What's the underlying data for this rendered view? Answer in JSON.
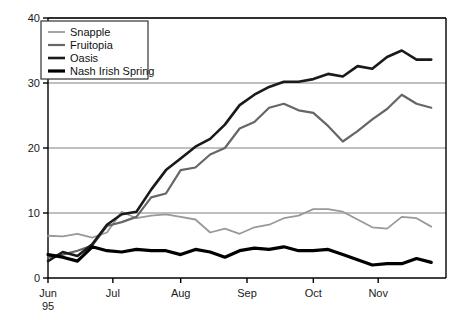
{
  "chart_data": {
    "type": "line",
    "title": "",
    "subtitle": "",
    "xlabel": "",
    "ylabel": "",
    "xlim": [
      0,
      27
    ],
    "ylim": [
      0,
      40
    ],
    "yticks": [
      0,
      10,
      20,
      30,
      40
    ],
    "ytick_labels": [
      "0",
      "10",
      "20",
      "30",
      "40"
    ],
    "xticks": [
      0,
      4.4,
      9.0,
      13.5,
      18.0,
      22.4
    ],
    "xtick_labels": [
      "Jun",
      "Jul",
      "Aug",
      "Sep",
      "Oct",
      "Nov"
    ],
    "x_first_tick_sublabel": "95",
    "grid": "horizontal",
    "grid_color": "#808080",
    "legend_position": "top-left",
    "axis_color": "#000000",
    "x": [
      0,
      1,
      2,
      3,
      4,
      5,
      6,
      7,
      8,
      9,
      10,
      11,
      12,
      13,
      14,
      15,
      16,
      17,
      18,
      19,
      20,
      21,
      22,
      23,
      24,
      25,
      26
    ],
    "series": [
      {
        "name": "Snapple",
        "color": "#999999",
        "width": 1.8,
        "values": [
          6.5,
          6.4,
          6.8,
          6.2,
          7.0,
          10.2,
          9.2,
          9.6,
          9.8,
          9.4,
          9.0,
          7.0,
          7.6,
          6.8,
          7.8,
          8.2,
          9.2,
          9.6,
          10.6,
          10.6,
          10.2,
          9.0,
          7.8,
          7.6,
          9.4,
          9.2,
          7.9
        ]
      },
      {
        "name": "Fruitopia",
        "color": "#666666",
        "width": 2.2,
        "values": [
          3.2,
          3.6,
          4.2,
          5.0,
          8.0,
          8.6,
          9.4,
          12.4,
          13.0,
          16.6,
          17.0,
          19.0,
          20.0,
          23.0,
          24.0,
          26.2,
          26.8,
          25.8,
          25.4,
          23.4,
          21.0,
          22.6,
          24.4,
          26.0,
          28.2,
          26.8,
          26.2
        ]
      },
      {
        "name": "Oasis",
        "color": "#1a1a1a",
        "width": 2.6,
        "values": [
          2.6,
          4.0,
          3.4,
          5.2,
          8.2,
          9.8,
          10.2,
          13.6,
          16.6,
          18.4,
          20.2,
          21.4,
          23.6,
          26.6,
          28.2,
          29.4,
          30.2,
          30.2,
          30.6,
          31.4,
          31.0,
          32.6,
          32.2,
          34.0,
          35.0,
          33.6,
          33.6
        ]
      },
      {
        "name": "Nash Irish Spring",
        "color": "#000000",
        "width": 3.2,
        "values": [
          3.6,
          3.2,
          2.6,
          4.8,
          4.2,
          4.0,
          4.4,
          4.2,
          4.2,
          3.6,
          4.4,
          4.0,
          3.2,
          4.2,
          4.6,
          4.4,
          4.8,
          4.2,
          4.2,
          4.4,
          3.6,
          2.8,
          2.0,
          2.2,
          2.2,
          3.0,
          2.4
        ]
      }
    ],
    "legend_entries": [
      "Snapple",
      "Fruitopia",
      "Oasis",
      "Nash Irish Spring"
    ]
  }
}
